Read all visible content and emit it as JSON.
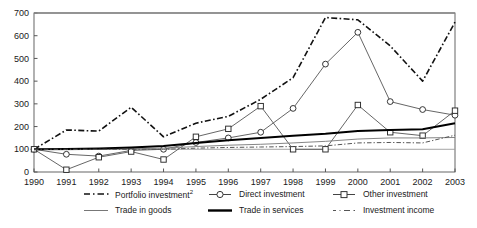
{
  "chart_data": {
    "type": "line",
    "title": "",
    "subtitle": "",
    "xlabel": "",
    "ylabel": "",
    "x": [
      1990,
      1991,
      1992,
      1993,
      1994,
      1995,
      1996,
      1997,
      1998,
      1999,
      2000,
      2001,
      2002,
      2003
    ],
    "categories": [
      "1990",
      "1991",
      "1992",
      "1993",
      "1994",
      "1995",
      "1996",
      "1997",
      "1998",
      "1999",
      "2000",
      "2001",
      "2002",
      "2003"
    ],
    "xlim": [
      1990,
      2003
    ],
    "ylim": [
      0,
      700
    ],
    "yticks": [
      0,
      100,
      200,
      300,
      400,
      500,
      600,
      700
    ],
    "ytick_labels": [
      "0",
      "100",
      "200",
      "300",
      "400",
      "500",
      "600",
      "700"
    ],
    "xticks": [
      1990,
      1991,
      1992,
      1993,
      1994,
      1995,
      1996,
      1997,
      1998,
      1999,
      2000,
      2001,
      2002,
      2003
    ],
    "grid": false,
    "legend_position": "bottom",
    "series": [
      {
        "name": "Portfolio investment",
        "footnote_marker": "2",
        "style": "dash-dot",
        "marker": "none",
        "color": "#111111",
        "width": 1.6,
        "values": [
          100,
          185,
          180,
          285,
          155,
          215,
          245,
          320,
          415,
          680,
          670,
          555,
          400,
          660
        ]
      },
      {
        "name": "Direct investment",
        "footnote_marker": "",
        "style": "solid-thin",
        "marker": "circle",
        "color": "#555555",
        "width": 0.9,
        "values": [
          100,
          78,
          70,
          95,
          100,
          130,
          150,
          175,
          280,
          475,
          615,
          310,
          275,
          250
        ]
      },
      {
        "name": "Other investment",
        "footnote_marker": "",
        "style": "solid-thin",
        "marker": "square",
        "color": "#555555",
        "width": 0.9,
        "values": [
          100,
          10,
          65,
          90,
          55,
          155,
          190,
          290,
          100,
          100,
          295,
          175,
          160,
          270
        ]
      },
      {
        "name": "Trade in goods",
        "footnote_marker": "",
        "style": "solid-thin",
        "marker": "none",
        "color": "#777777",
        "width": 0.9,
        "values": [
          100,
          98,
          100,
          102,
          105,
          112,
          118,
          122,
          128,
          135,
          145,
          150,
          150,
          152
        ]
      },
      {
        "name": "Trade in services",
        "footnote_marker": "",
        "style": "solid-thick",
        "marker": "none",
        "color": "#000000",
        "width": 2.0,
        "values": [
          100,
          101,
          104,
          108,
          114,
          128,
          140,
          150,
          160,
          168,
          180,
          185,
          188,
          215
        ]
      },
      {
        "name": "Investment income",
        "footnote_marker": "",
        "style": "dash-dot-thin",
        "marker": "none",
        "color": "#555555",
        "width": 1.0,
        "values": [
          100,
          100,
          100,
          100,
          100,
          105,
          108,
          110,
          112,
          115,
          128,
          130,
          128,
          162
        ]
      }
    ],
    "reference_line_y": 100
  },
  "legend": {
    "row1": [
      {
        "label": "Portfolio investment",
        "sup": "2",
        "icon": "dash-dot-line-icon"
      },
      {
        "label": "Direct investment",
        "sup": "",
        "icon": "circle-marker-line-icon"
      },
      {
        "label": "Other investment",
        "sup": "",
        "icon": "square-marker-line-icon"
      }
    ],
    "row2": [
      {
        "label": "Trade in goods",
        "sup": "",
        "icon": "thin-line-icon"
      },
      {
        "label": "Trade in services",
        "sup": "",
        "icon": "thick-line-icon"
      },
      {
        "label": "Investment income",
        "sup": "",
        "icon": "dash-dot-thin-line-icon"
      }
    ]
  }
}
